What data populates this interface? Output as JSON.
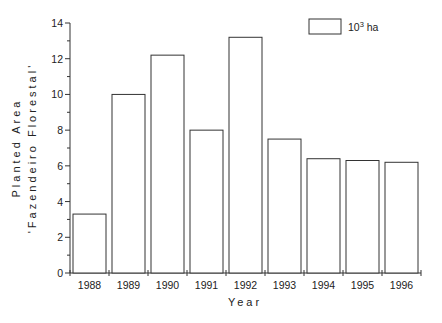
{
  "chart_data": {
    "type": "bar",
    "title": "",
    "xlabel": "Year",
    "ylabel_line1": "Planted Area",
    "ylabel_line2": "'Fazendeiro Florestal'",
    "categories": [
      "1988",
      "1989",
      "1990",
      "1991",
      "1992",
      "1993",
      "1994",
      "1995",
      "1996"
    ],
    "series": [
      {
        "name": "10³ ha",
        "values": [
          3.3,
          10.0,
          12.2,
          8.0,
          13.2,
          7.5,
          6.4,
          6.3,
          6.2
        ]
      }
    ],
    "ylim": [
      0,
      14
    ],
    "yticks": [
      0,
      2,
      4,
      6,
      8,
      10,
      12,
      14
    ],
    "grid": false,
    "legend_position": "top-right",
    "bar_fill": "#ffffff",
    "bar_stroke": "#333333"
  },
  "legend": {
    "base": "10",
    "sup": "3",
    "unit": " ha"
  }
}
